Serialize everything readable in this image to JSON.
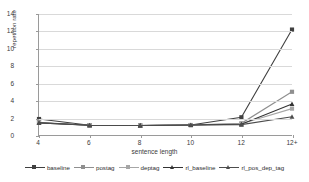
{
  "chart_data": {
    "type": "line",
    "title": "",
    "xlabel": "sentence length",
    "ylabel": "repetition rate",
    "categories": [
      "4",
      "6",
      "8",
      "10",
      "12",
      "12+"
    ],
    "yticks": [
      0,
      2,
      4,
      6,
      8,
      10,
      12,
      14
    ],
    "ylim": [
      0,
      14
    ],
    "grid": true,
    "legend_position": "bottom",
    "series": [
      {
        "name": "baseline",
        "values": [
          1.85,
          1.12,
          1.1,
          1.15,
          2.05,
          12.2
        ],
        "color": "#404040",
        "marker": "square"
      },
      {
        "name": "postag",
        "values": [
          1.45,
          1.12,
          1.1,
          1.15,
          1.35,
          5.0
        ],
        "color": "#8f8f8f",
        "marker": "square"
      },
      {
        "name": "deptag",
        "values": [
          1.45,
          1.12,
          1.1,
          1.15,
          1.3,
          3.05
        ],
        "color": "#a6a6a6",
        "marker": "square"
      },
      {
        "name": "rl_baseline",
        "values": [
          1.4,
          1.12,
          1.1,
          1.15,
          1.25,
          3.6
        ],
        "color": "#333333",
        "marker": "triangle"
      },
      {
        "name": "rl_pos_dep_tag",
        "values": [
          1.4,
          1.12,
          1.1,
          1.15,
          1.2,
          2.12
        ],
        "color": "#4d4d4d",
        "marker": "triangle"
      }
    ]
  },
  "axes": {
    "x_title": "sentence length",
    "y_title": "repetition rate",
    "x_labels": [
      "4",
      "6",
      "8",
      "10",
      "12",
      "12+"
    ],
    "y_labels": [
      "0",
      "2",
      "4",
      "6",
      "8",
      "10",
      "12",
      "14"
    ]
  },
  "legend": {
    "items": [
      {
        "label": "baseline"
      },
      {
        "label": "postag"
      },
      {
        "label": "deptag"
      },
      {
        "label": "rl_baseline"
      },
      {
        "label": "rl_pos_dep_tag"
      }
    ]
  }
}
